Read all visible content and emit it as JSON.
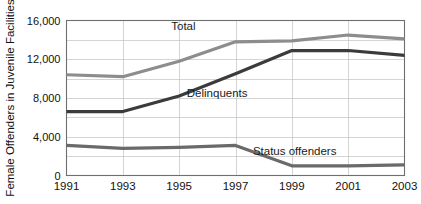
{
  "chart_data": {
    "type": "line",
    "title": "",
    "xlabel": "",
    "ylabel": "Female Offenders in Juvenile Facilities",
    "x": [
      1991,
      1993,
      1995,
      1997,
      1999,
      2001,
      2003
    ],
    "xtick_labels": [
      "1991",
      "1993",
      "1995",
      "1997",
      "1999",
      "2001",
      "2003"
    ],
    "ytick_labels": [
      "0",
      "4,000",
      "8,000",
      "12,000",
      "16,000"
    ],
    "ytick_values": [
      0,
      4000,
      8000,
      12000,
      16000
    ],
    "gridline_values": [
      0,
      2000,
      4000,
      6000,
      8000,
      10000,
      12000,
      14000,
      16000
    ],
    "ylim": [
      0,
      16000
    ],
    "xlim": [
      1991,
      2003
    ],
    "grid": true,
    "legend_position": "inline-annotations",
    "series": [
      {
        "name": "Total",
        "color": "#8d8d8d",
        "width": 3.2,
        "values": [
          10400,
          10200,
          11800,
          13800,
          13900,
          14500,
          14100
        ],
        "annotation": {
          "text": "Total",
          "x": 1995.15,
          "y": 15050
        }
      },
      {
        "name": "Delinquents",
        "color": "#3b3b3b",
        "width": 3.2,
        "values": [
          6600,
          6600,
          8200,
          10500,
          12900,
          12900,
          12400
        ],
        "annotation": {
          "text": "Delinquents",
          "x": 1996.35,
          "y": 8150
        }
      },
      {
        "name": "Status offenders",
        "color": "#6a6a6a",
        "width": 3.2,
        "values": [
          3100,
          2800,
          2900,
          3100,
          1000,
          1000,
          1100
        ],
        "annotation": {
          "text": "Status offenders",
          "x": 1999.1,
          "y": 2150
        }
      }
    ],
    "colors": {
      "background": "#ffffff",
      "grid": "#c9c9c9",
      "frame": "#6e6e6e",
      "text": "#111111",
      "total_line": "#8d8d8d",
      "delinquents_line": "#3b3b3b",
      "status_line": "#6a6a6a"
    }
  }
}
